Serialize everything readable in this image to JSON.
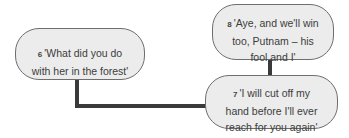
{
  "diagram": {
    "nodes": [
      {
        "id": "6",
        "number": "6",
        "text": "'What did you do\nwith her in the forest'"
      },
      {
        "id": "8",
        "number": "8",
        "text": "'Aye, and we'll win\ntoo, Putnam – his\nfool and I'"
      },
      {
        "id": "7",
        "number": "7",
        "text": "'I will cut off my\nhand before I'll ever\nreach for you again'"
      }
    ],
    "edges": [
      {
        "from": "6",
        "to": "7"
      },
      {
        "from": "8",
        "to": "7"
      }
    ],
    "colors": {
      "node_fill": "#ececec",
      "node_border": "#6e6e6e",
      "connector": "#3a3a3a",
      "text": "#3c3c3c"
    }
  }
}
